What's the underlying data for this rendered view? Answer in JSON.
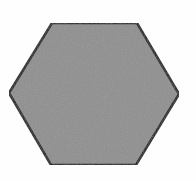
{
  "diagram": {
    "shape": "hexagon",
    "orientation": "flat-top",
    "fill_color": "#8f8f8f",
    "stroke_color": "#1a1a1a",
    "stroke_width": 2.5,
    "background_color": "#fefefe",
    "vertices": [
      [
        52,
        23
      ],
      [
        137,
        23
      ],
      [
        179,
        94
      ],
      [
        136,
        165
      ],
      [
        51,
        165
      ],
      [
        9,
        93
      ]
    ]
  }
}
